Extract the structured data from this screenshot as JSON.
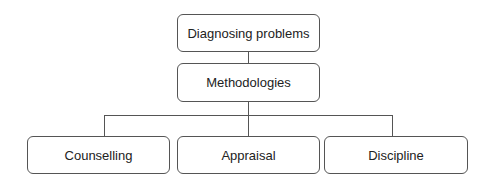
{
  "diagram": {
    "root": {
      "label": "Diagnosing problems"
    },
    "middle": {
      "label": "Methodologies"
    },
    "children": [
      {
        "label": "Counselling"
      },
      {
        "label": "Appraisal"
      },
      {
        "label": "Discipline"
      }
    ],
    "colors": {
      "stroke": "#555555",
      "text": "#222222",
      "background": "#ffffff"
    }
  }
}
